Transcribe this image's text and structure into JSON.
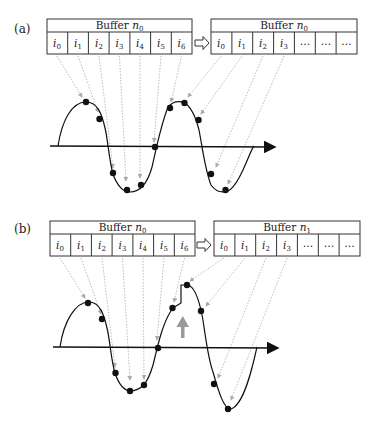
{
  "panels": [
    {
      "label": "(a)",
      "buffer_left": {
        "title": "Buffer ",
        "sub": "0",
        "var": "n",
        "cells": [
          "0",
          "1",
          "2",
          "3",
          "4",
          "5",
          "6"
        ]
      },
      "buffer_right": {
        "title": "Buffer ",
        "sub": "0",
        "var": "n",
        "cells": [
          "0",
          "1",
          "2",
          "3",
          "…",
          "…",
          "…"
        ]
      },
      "arrow_icon": "hollow-right-arrow"
    },
    {
      "label": "(b)",
      "buffer_left": {
        "title": "Buffer ",
        "sub": "0",
        "var": "n",
        "cells": [
          "0",
          "1",
          "2",
          "3",
          "4",
          "5",
          "6"
        ]
      },
      "buffer_right": {
        "title": "Buffer ",
        "sub": "1",
        "var": "n",
        "cells": [
          "0",
          "1",
          "2",
          "3",
          "…",
          "…",
          "…"
        ]
      },
      "arrow_icon": "hollow-right-arrow",
      "discontinuity_marker": "gray-up-arrow"
    }
  ],
  "colors": {
    "line": "#111111",
    "guide": "#aaaaaa",
    "marker": "#999999"
  }
}
